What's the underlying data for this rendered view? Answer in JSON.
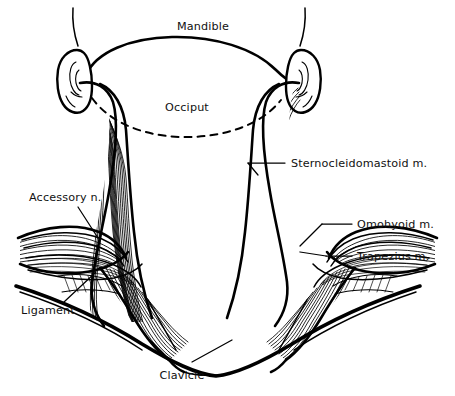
{
  "figure": {
    "background_color": "#ffffff",
    "ink_color": "#000000"
  },
  "labels": {
    "mandible": "Mandible",
    "occiput": "Occiput",
    "sternocleidomastoid": "Sternocleidomastoid m.",
    "omohyoid": "Omohyoid m.",
    "trapezius": "Trapezius m.",
    "accessory_nerve": "Accessory n.",
    "ligament": "Ligament",
    "clavicle": "Clavicle"
  },
  "structures": [
    {
      "name": "mandible",
      "label": "Mandible",
      "kind": "bone",
      "side": "midline"
    },
    {
      "name": "occiput",
      "label": "Occiput",
      "kind": "bone",
      "side": "midline",
      "line_style": "dashed"
    },
    {
      "name": "sternocleidomastoid",
      "label": "Sternocleidomastoid m.",
      "kind": "muscle",
      "side": "bilateral"
    },
    {
      "name": "omohyoid",
      "label": "Omohyoid m.",
      "kind": "muscle",
      "side": "bilateral"
    },
    {
      "name": "trapezius",
      "label": "Trapezius m.",
      "kind": "muscle",
      "side": "bilateral"
    },
    {
      "name": "accessory-nerve",
      "label": "Accessory n.",
      "kind": "nerve",
      "side": "bilateral"
    },
    {
      "name": "ligament",
      "label": "Ligament",
      "kind": "ligament",
      "side": "left"
    },
    {
      "name": "clavicle",
      "label": "Clavicle",
      "kind": "bone",
      "side": "bilateral"
    },
    {
      "name": "ear",
      "label": "",
      "kind": "surface-landmark",
      "side": "bilateral"
    }
  ]
}
